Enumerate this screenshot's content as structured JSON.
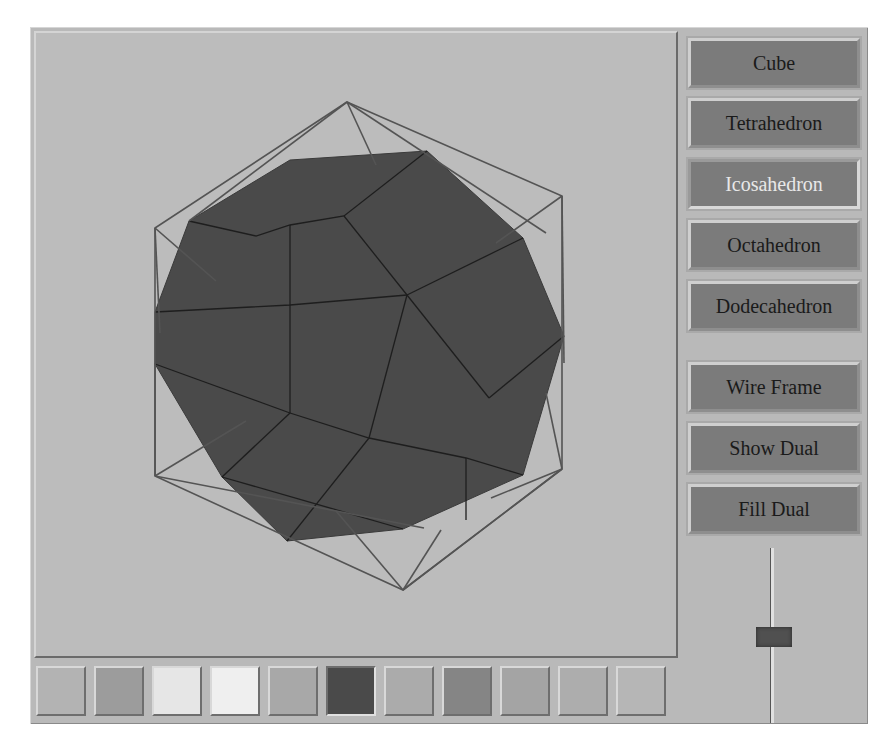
{
  "canvas": {
    "background": "#bcbcbc",
    "fill_color": "#4a4a4a",
    "wire_color": "#505050",
    "solid": "Dodecahedron (filled dual)",
    "wire": "Icosahedron"
  },
  "sidebar": {
    "shape_buttons": [
      {
        "label": "Cube",
        "selected": false
      },
      {
        "label": "Tetrahedron",
        "selected": false
      },
      {
        "label": "Icosahedron",
        "selected": true
      },
      {
        "label": "Octahedron",
        "selected": false
      },
      {
        "label": "Dodecahedron",
        "selected": false
      }
    ],
    "option_buttons": [
      {
        "label": "Wire Frame"
      },
      {
        "label": "Show Dual"
      },
      {
        "label": "Fill Dual"
      }
    ],
    "slider": {
      "orientation": "vertical",
      "position_pct": 48
    }
  },
  "palette": {
    "swatches": [
      {
        "color": "#b3b3b3",
        "selected": false
      },
      {
        "color": "#9c9c9c",
        "selected": false
      },
      {
        "color": "#e6e6e6",
        "selected": false
      },
      {
        "color": "#efefef",
        "selected": false
      },
      {
        "color": "#a8a8a8",
        "selected": false
      },
      {
        "color": "#4a4a4a",
        "selected": true
      },
      {
        "color": "#ababab",
        "selected": false
      },
      {
        "color": "#858585",
        "selected": false
      },
      {
        "color": "#a4a4a4",
        "selected": false
      },
      {
        "color": "#adadad",
        "selected": false
      },
      {
        "color": "#b6b6b6",
        "selected": false
      }
    ]
  }
}
